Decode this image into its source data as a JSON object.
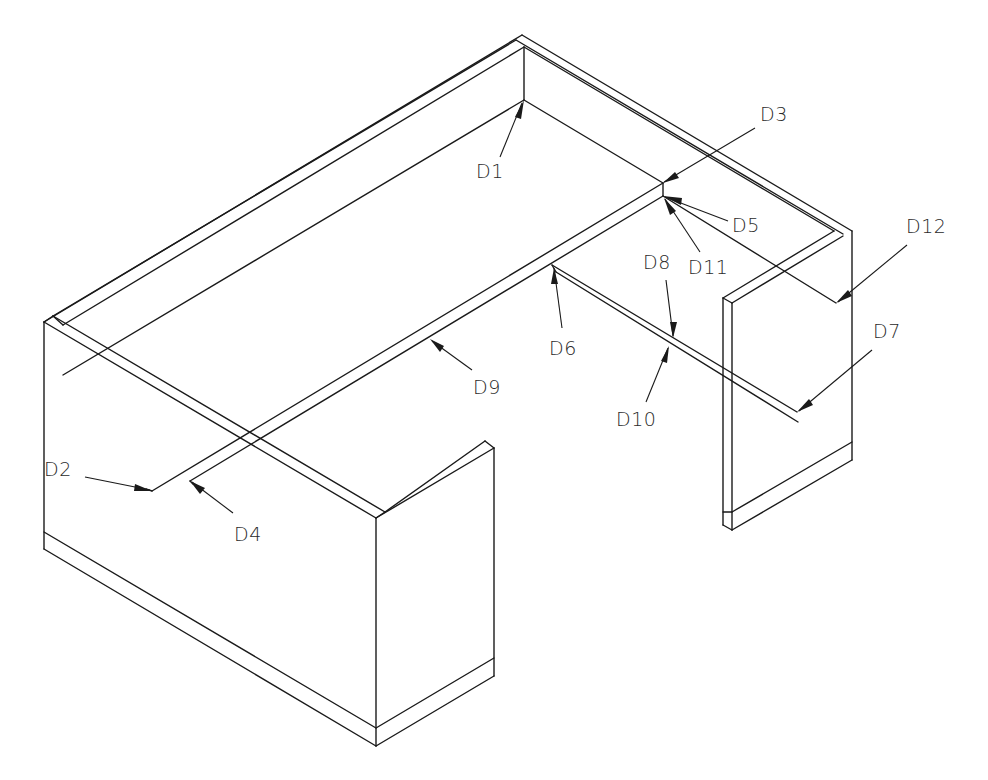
{
  "drawing": {
    "type": "isometric line drawing",
    "subject": "U-shaped desk workstation with wall panels",
    "line_color": "#1a1a1a",
    "background": "#ffffff"
  },
  "labels": [
    {
      "id": "D1",
      "text": "D1",
      "x": 476,
      "y": 162
    },
    {
      "id": "D2",
      "text": "D2",
      "x": 44,
      "y": 460
    },
    {
      "id": "D3",
      "text": "D3",
      "x": 760,
      "y": 105
    },
    {
      "id": "D4",
      "text": "D4",
      "x": 234,
      "y": 525
    },
    {
      "id": "D5",
      "text": "D5",
      "x": 732,
      "y": 216
    },
    {
      "id": "D6",
      "text": "D6",
      "x": 549,
      "y": 339
    },
    {
      "id": "D7",
      "text": "D7",
      "x": 873,
      "y": 322
    },
    {
      "id": "D8",
      "text": "D8",
      "x": 643,
      "y": 253
    },
    {
      "id": "D9",
      "text": "D9",
      "x": 473,
      "y": 378
    },
    {
      "id": "D10",
      "text": "D10",
      "x": 616,
      "y": 410
    },
    {
      "id": "D11",
      "text": "D11",
      "x": 688,
      "y": 258
    },
    {
      "id": "D12",
      "text": "D12",
      "x": 906,
      "y": 217
    }
  ]
}
